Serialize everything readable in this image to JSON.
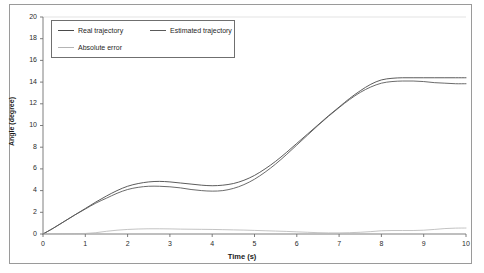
{
  "chart_data": {
    "type": "line",
    "title": "",
    "xlabel": "Time (s)",
    "ylabel": "Angle (degree)",
    "xlim": [
      0,
      10
    ],
    "ylim": [
      0,
      20
    ],
    "xticks": [
      "0",
      "1",
      "2",
      "3",
      "4",
      "5",
      "6",
      "7",
      "8",
      "9",
      "10"
    ],
    "yticks": [
      "0",
      "2",
      "4",
      "6",
      "8",
      "10",
      "12",
      "14",
      "16",
      "18",
      "20"
    ],
    "grid": false,
    "legend_position": "upper-left",
    "x": [
      0,
      0.25,
      0.5,
      0.75,
      1,
      1.25,
      1.5,
      1.75,
      2,
      2.25,
      2.5,
      2.75,
      3,
      3.25,
      3.5,
      3.75,
      4,
      4.25,
      4.5,
      4.75,
      5,
      5.25,
      5.5,
      5.75,
      6,
      6.25,
      6.5,
      6.75,
      7,
      7.25,
      7.5,
      7.75,
      8,
      8.25,
      8.5,
      8.75,
      9,
      9.25,
      9.5,
      9.75,
      10
    ],
    "series": [
      {
        "name": "Real trajectory",
        "color": "#4a4a4a",
        "values": [
          0,
          0.55,
          1.15,
          1.75,
          2.35,
          2.95,
          3.5,
          4.0,
          4.4,
          4.65,
          4.8,
          4.85,
          4.8,
          4.7,
          4.6,
          4.5,
          4.45,
          4.5,
          4.65,
          4.95,
          5.4,
          6.0,
          6.7,
          7.5,
          8.35,
          9.2,
          10.05,
          10.9,
          11.7,
          12.5,
          13.2,
          13.8,
          14.2,
          14.35,
          14.4,
          14.4,
          14.4,
          14.4,
          14.4,
          14.4,
          14.4
        ]
      },
      {
        "name": "Estimated trajectory",
        "color": "#5a5a5a",
        "values": [
          0,
          0.55,
          1.15,
          1.75,
          2.3,
          2.85,
          3.3,
          3.75,
          4.1,
          4.3,
          4.4,
          4.4,
          4.35,
          4.25,
          4.1,
          4.0,
          3.95,
          4.0,
          4.2,
          4.55,
          5.05,
          5.7,
          6.45,
          7.3,
          8.2,
          9.1,
          10.0,
          10.85,
          11.65,
          12.4,
          13.05,
          13.55,
          13.9,
          14.05,
          14.1,
          14.1,
          14.05,
          13.95,
          13.9,
          13.85,
          13.85
        ]
      },
      {
        "name": "Absolute error",
        "color": "#b4b4b4",
        "values": [
          0,
          0.02,
          0.03,
          0.04,
          0.05,
          0.12,
          0.25,
          0.35,
          0.42,
          0.46,
          0.48,
          0.48,
          0.47,
          0.45,
          0.44,
          0.43,
          0.42,
          0.4,
          0.38,
          0.36,
          0.33,
          0.3,
          0.27,
          0.24,
          0.2,
          0.16,
          0.12,
          0.1,
          0.1,
          0.12,
          0.16,
          0.22,
          0.3,
          0.32,
          0.32,
          0.32,
          0.35,
          0.42,
          0.5,
          0.54,
          0.55
        ]
      }
    ]
  },
  "legend": {
    "entries": [
      {
        "label": "Real trajectory",
        "color": "#4a4a4a"
      },
      {
        "label": "Estimated trajectory",
        "color": "#5a5a5a"
      },
      {
        "label": "Absolute error",
        "color": "#b4b4b4"
      }
    ]
  },
  "colors": {
    "frame": "#9a9a9a",
    "axis": "#6f6f6f",
    "gridline": "#d9d9d9",
    "text": "#1a1a1a"
  }
}
